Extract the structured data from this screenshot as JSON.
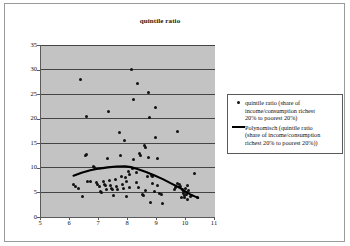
{
  "chart_data": {
    "type": "scatter",
    "title": "quintile ratio",
    "xlabel": "",
    "ylabel": "",
    "xlim": [
      5,
      11
    ],
    "ylim": [
      0,
      35
    ],
    "xticks": [
      5,
      6,
      7,
      8,
      9,
      10,
      11
    ],
    "yticks": [
      0,
      5,
      10,
      15,
      20,
      25,
      30,
      35
    ],
    "grid": "horizontal",
    "legend_position": "right",
    "plot_background": "#c3c3c3",
    "marker_color": "#111111",
    "trendline_color": "#000000",
    "series": [
      {
        "name": "quintile ratio (share of income/consumption richest 20% to poorest 20%)",
        "type": "scatter",
        "points": [
          [
            6.13,
            6.7
          ],
          [
            6.2,
            6.3
          ],
          [
            6.3,
            5.9
          ],
          [
            6.37,
            28.0
          ],
          [
            6.42,
            4.1
          ],
          [
            6.52,
            12.5
          ],
          [
            6.58,
            12.7
          ],
          [
            6.58,
            20.5
          ],
          [
            6.62,
            7.3
          ],
          [
            6.72,
            7.2
          ],
          [
            6.82,
            10.2
          ],
          [
            6.86,
            10.1
          ],
          [
            6.9,
            7.1
          ],
          [
            6.96,
            6.6
          ],
          [
            7.0,
            6.2
          ],
          [
            7.05,
            5.1
          ],
          [
            7.08,
            5.0
          ],
          [
            7.14,
            7.3
          ],
          [
            7.18,
            6.6
          ],
          [
            7.22,
            6.4
          ],
          [
            7.26,
            5.6
          ],
          [
            7.3,
            11.9
          ],
          [
            7.32,
            21.5
          ],
          [
            7.36,
            7.4
          ],
          [
            7.4,
            6.5
          ],
          [
            7.42,
            5.9
          ],
          [
            7.46,
            5.5
          ],
          [
            7.5,
            4.3
          ],
          [
            7.56,
            7.6
          ],
          [
            7.6,
            6.2
          ],
          [
            7.64,
            5.6
          ],
          [
            7.7,
            17.1
          ],
          [
            7.74,
            12.6
          ],
          [
            7.78,
            8.2
          ],
          [
            7.8,
            6.6
          ],
          [
            7.84,
            5.8
          ],
          [
            7.88,
            15.6
          ],
          [
            7.9,
            8.0
          ],
          [
            7.94,
            7.3
          ],
          [
            7.96,
            4.1
          ],
          [
            8.0,
            9.3
          ],
          [
            8.04,
            8.7
          ],
          [
            8.06,
            6.0
          ],
          [
            8.12,
            30.0
          ],
          [
            8.14,
            9.9
          ],
          [
            8.18,
            11.6
          ],
          [
            8.2,
            24.0
          ],
          [
            8.28,
            9.0
          ],
          [
            8.3,
            7.1
          ],
          [
            8.32,
            27.1
          ],
          [
            8.36,
            6.0
          ],
          [
            8.4,
            12.9
          ],
          [
            8.44,
            12.6
          ],
          [
            8.5,
            4.6
          ],
          [
            8.52,
            4.4
          ],
          [
            8.56,
            14.6
          ],
          [
            8.6,
            14.2
          ],
          [
            8.62,
            5.3
          ],
          [
            8.66,
            8.2
          ],
          [
            8.7,
            25.4
          ],
          [
            8.72,
            12.2
          ],
          [
            8.74,
            20.3
          ],
          [
            8.76,
            2.9
          ],
          [
            8.8,
            8.4
          ],
          [
            8.84,
            8.3
          ],
          [
            8.86,
            6.9
          ],
          [
            8.9,
            5.2
          ],
          [
            8.94,
            16.2
          ],
          [
            8.96,
            22.3
          ],
          [
            9.0,
            11.9
          ],
          [
            9.02,
            6.4
          ],
          [
            9.1,
            4.7
          ],
          [
            9.16,
            4.5
          ],
          [
            9.2,
            2.7
          ],
          [
            9.6,
            5.5
          ],
          [
            9.64,
            6.0
          ],
          [
            9.7,
            17.4
          ],
          [
            9.72,
            6.8
          ],
          [
            9.76,
            6.6
          ],
          [
            9.8,
            6.3
          ],
          [
            9.84,
            4.0
          ],
          [
            9.88,
            5.6
          ],
          [
            9.9,
            5.2
          ],
          [
            9.92,
            4.8
          ],
          [
            9.94,
            4.4
          ],
          [
            9.96,
            3.9
          ],
          [
            9.98,
            5.9
          ],
          [
            10.0,
            5.0
          ],
          [
            10.02,
            4.6
          ],
          [
            10.04,
            3.6
          ],
          [
            10.06,
            6.5
          ],
          [
            10.1,
            5.3
          ],
          [
            10.14,
            4.2
          ],
          [
            10.2,
            4.4
          ],
          [
            10.28,
            8.9
          ],
          [
            10.38,
            4.0
          ]
        ]
      },
      {
        "name": "Polynomisch (quintile ratio (share of income/consumption richest 20% to poorest 20%))",
        "type": "line",
        "points": [
          [
            6.12,
            8.4
          ],
          [
            6.4,
            9.0
          ],
          [
            6.7,
            9.5
          ],
          [
            7.0,
            9.85
          ],
          [
            7.3,
            10.1
          ],
          [
            7.6,
            10.28
          ],
          [
            7.9,
            10.3
          ],
          [
            8.1,
            10.15
          ],
          [
            8.3,
            9.8
          ],
          [
            8.6,
            9.2
          ],
          [
            8.9,
            8.5
          ],
          [
            9.2,
            7.7
          ],
          [
            9.5,
            6.8
          ],
          [
            9.8,
            5.9
          ],
          [
            10.0,
            5.1
          ],
          [
            10.15,
            4.6
          ],
          [
            10.3,
            4.2
          ],
          [
            10.42,
            3.9
          ]
        ]
      }
    ],
    "legend": [
      {
        "marker": "dot",
        "lines": [
          "quintile ratio (share of",
          "income/consumption richest",
          "20% to poorest 20%)"
        ]
      },
      {
        "marker": "line",
        "lines": [
          "Polynomisch (quintile ratio",
          "(share of income/consumption",
          "richest 20% to poorest 20%))"
        ]
      }
    ]
  }
}
